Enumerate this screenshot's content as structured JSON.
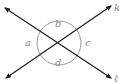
{
  "diagram": {
    "type": "intersecting-lines",
    "lines": [
      {
        "name": "k",
        "label": "k",
        "from": [
          6,
          78
        ],
        "to": [
          111,
          6
        ]
      },
      {
        "name": "l",
        "label": "ℓ",
        "from": [
          5,
          8
        ],
        "to": [
          111,
          78
        ]
      }
    ],
    "intersection": [
      59,
      43
    ],
    "angles": [
      {
        "name": "a",
        "label": "a",
        "position": "left"
      },
      {
        "name": "b",
        "label": "b",
        "position": "top"
      },
      {
        "name": "c",
        "label": "c",
        "position": "right"
      },
      {
        "name": "d",
        "label": "d",
        "position": "bottom"
      }
    ],
    "colors": {
      "lines": "#1a1a1a",
      "circle": "#9a9a9a",
      "labels": "#8a8a8a"
    }
  }
}
